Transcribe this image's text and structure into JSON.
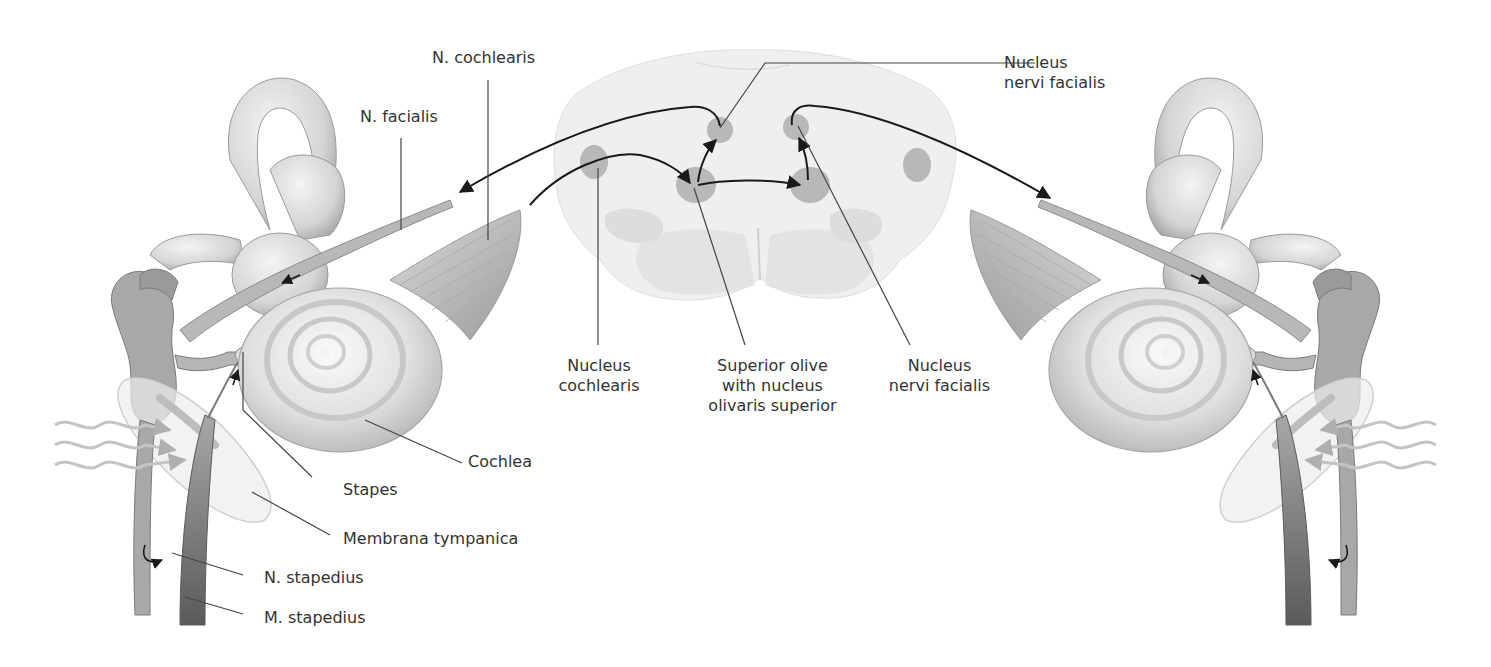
{
  "figure": {
    "labels": {
      "n_cochlearis": "N. cochlearis",
      "n_facialis": "N. facialis",
      "nucleus_nervi_facialis_top": [
        "Nucleus",
        "nervi facialis"
      ],
      "nucleus_cochlearis": [
        "Nucleus",
        "cochlearis"
      ],
      "superior_olive": [
        "Superior olive",
        "with nucleus",
        "olivaris superior"
      ],
      "nucleus_nervi_facialis_bottom": [
        "Nucleus",
        "nervi facialis"
      ],
      "cochlea": "Cochlea",
      "stapes": "Stapes",
      "membrana_tympanica": "Membrana tympanica",
      "n_stapedius": "N. stapedius",
      "m_stapedius": "M. stapedius"
    },
    "colors": {
      "background": "#ffffff",
      "text": "#333333",
      "leader_line": "#444444",
      "pathway_arrow": "#1a1a1a",
      "nucleus_fill": "#b8b8b8",
      "brainstem_fill": "#eeeeee",
      "ear_structure": "#d6d6d6",
      "sound_wave": "#c4c4c4"
    }
  }
}
